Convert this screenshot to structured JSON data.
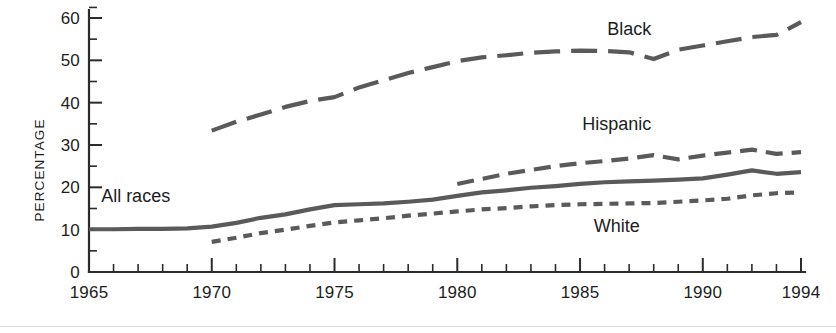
{
  "chart_data": {
    "type": "line",
    "title": "",
    "xlabel": "",
    "ylabel": "PERCENTAGE",
    "xlim": [
      1965,
      1994
    ],
    "ylim": [
      0,
      60
    ],
    "grid": false,
    "legend_position": "inline-annotations",
    "x_ticks_major": [
      1965,
      1970,
      1975,
      1980,
      1985,
      1990,
      1994
    ],
    "x_tick_labels": [
      "1965",
      "1970",
      "1975",
      "1980",
      "1985",
      "1990",
      "1994"
    ],
    "x_ticks_minor_step": 1,
    "y_ticks_major": [
      0,
      10,
      20,
      30,
      40,
      50,
      60
    ],
    "y_tick_labels": [
      "0",
      "10",
      "20",
      "30",
      "40",
      "50",
      "60"
    ],
    "y_ticks_minor": [
      5,
      15,
      25,
      35,
      45,
      55
    ],
    "series": [
      {
        "name": "All races",
        "label": "All races",
        "style": "solid",
        "color": "#5a5a5a",
        "x": [
          1965,
          1966,
          1967,
          1968,
          1969,
          1970,
          1971,
          1972,
          1973,
          1974,
          1975,
          1976,
          1977,
          1978,
          1979,
          1980,
          1981,
          1982,
          1983,
          1984,
          1985,
          1986,
          1987,
          1988,
          1989,
          1990,
          1991,
          1992,
          1993,
          1994
        ],
        "y": [
          10.1,
          10.1,
          10.2,
          10.2,
          10.3,
          10.7,
          11.6,
          12.8,
          13.6,
          14.8,
          15.8,
          16.0,
          16.2,
          16.6,
          17.1,
          18.0,
          18.8,
          19.3,
          19.9,
          20.3,
          20.8,
          21.2,
          21.4,
          21.6,
          21.8,
          22.1,
          23.0,
          24.0,
          23.2,
          23.6
        ]
      },
      {
        "name": "Black",
        "label": "Black",
        "style": "long-dash",
        "color": "#5a5a5a",
        "x": [
          1970,
          1971,
          1972,
          1973,
          1974,
          1975,
          1976,
          1977,
          1978,
          1979,
          1980,
          1981,
          1982,
          1983,
          1984,
          1985,
          1986,
          1987,
          1988,
          1989,
          1990,
          1991,
          1992,
          1993,
          1994
        ],
        "y": [
          33.4,
          35.5,
          37.2,
          39.0,
          40.4,
          41.3,
          43.6,
          45.3,
          47.0,
          48.4,
          49.8,
          50.7,
          51.2,
          51.8,
          52.1,
          52.3,
          52.2,
          51.9,
          50.3,
          52.5,
          53.5,
          54.5,
          55.5,
          56.0,
          59.0
        ]
      },
      {
        "name": "Hispanic",
        "label": "Hispanic",
        "style": "dash",
        "color": "#5a5a5a",
        "x": [
          1980,
          1981,
          1982,
          1983,
          1984,
          1985,
          1986,
          1987,
          1988,
          1989,
          1990,
          1991,
          1992,
          1993,
          1994
        ],
        "y": [
          20.8,
          22.0,
          23.2,
          24.1,
          25.0,
          25.7,
          26.2,
          26.8,
          27.6,
          26.6,
          27.5,
          28.2,
          28.9,
          27.9,
          28.3
        ]
      },
      {
        "name": "White",
        "label": "White",
        "style": "short-dash",
        "color": "#5a5a5a",
        "x": [
          1970,
          1971,
          1972,
          1973,
          1974,
          1975,
          1976,
          1977,
          1978,
          1979,
          1980,
          1981,
          1982,
          1983,
          1984,
          1985,
          1986,
          1987,
          1988,
          1989,
          1990,
          1991,
          1992,
          1993,
          1994
        ],
        "y": [
          7.1,
          8.1,
          9.2,
          10.0,
          10.9,
          11.7,
          12.2,
          12.7,
          13.3,
          13.8,
          14.3,
          14.8,
          15.1,
          15.5,
          15.8,
          16.0,
          16.1,
          16.2,
          16.3,
          16.6,
          16.9,
          17.3,
          18.1,
          18.6,
          18.8
        ]
      }
    ],
    "annotations": [
      {
        "text": "Black",
        "x": 1987.0,
        "y": 56.0
      },
      {
        "text": "Hispanic",
        "x": 1986.5,
        "y": 33.5
      },
      {
        "text": "All races",
        "x": 1966.9,
        "y": 16.5
      },
      {
        "text": "White",
        "x": 1986.5,
        "y": 9.5
      }
    ]
  }
}
